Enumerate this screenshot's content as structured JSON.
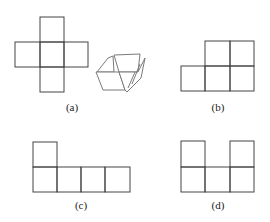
{
  "figure": {
    "stroke_color": "#444444",
    "panels": [
      {
        "id": "a",
        "label": "(a)",
        "shape": "cross of 5 squares",
        "extra": "partially folded box illustration"
      },
      {
        "id": "b",
        "label": "(b)",
        "shape": "2 squares over 3 squares, right-aligned"
      },
      {
        "id": "c",
        "label": "(c)",
        "shape": "1 square over 4 squares, left-aligned"
      },
      {
        "id": "d",
        "label": "(d)",
        "shape": "squares at both ends over a row of 3"
      }
    ]
  }
}
